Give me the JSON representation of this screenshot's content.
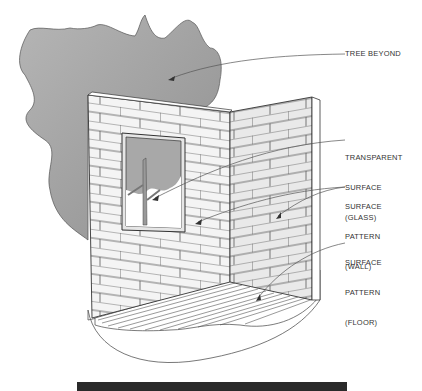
{
  "figure": {
    "labels": {
      "tree": "TREE BEYOND",
      "glass_1": "TRANSPARENT",
      "glass_2": "SURFACE",
      "glass_3": "(GLASS)",
      "wall_1": "SURFACE",
      "wall_2": "PATTERN",
      "wall_3": "(WALL)",
      "floor_1": "SURFACE",
      "floor_2": "PATTERN",
      "floor_3": "(FLOOR)"
    },
    "colors": {
      "tree_fill": "#a8a8a8",
      "line": "#333333",
      "wall": "#f2f2f2",
      "footer_bar": "#2a2a2a"
    }
  }
}
